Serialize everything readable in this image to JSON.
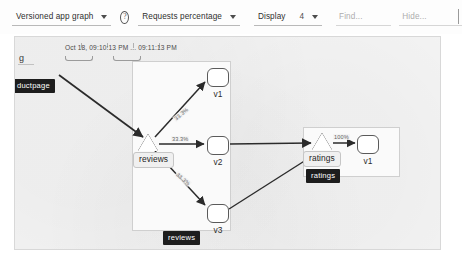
{
  "toolbar": {
    "graph_type": {
      "label": "Versioned app graph",
      "icon": "chevron-down-icon"
    },
    "help": {
      "icon": "help-circle-icon",
      "glyph": "?"
    },
    "edge_labels": {
      "label": "Requests percentage",
      "icon": "chevron-down-icon"
    },
    "display": {
      "label": "Display",
      "value": "4",
      "icon": "chevron-down-icon"
    },
    "find": {
      "placeholder": "Find..."
    },
    "hide": {
      "placeholder": "Hide..."
    }
  },
  "canvas": {
    "time_range": "Oct 18, 09:10:13 PM ... 09:11:13 PM",
    "g_letter": "g",
    "badges": {
      "productpage": "ductpage",
      "reviews": "reviews",
      "ratings": "ratings"
    },
    "clusters": [
      {
        "name": "reviews",
        "service_label": "reviews"
      },
      {
        "name": "ratings",
        "service_label": "ratings"
      }
    ],
    "nodes": [
      {
        "id": "reviews-svc",
        "shape": "triangle",
        "label": "reviews"
      },
      {
        "id": "reviews-v1",
        "shape": "rounded-box",
        "label": "v1"
      },
      {
        "id": "reviews-v2",
        "shape": "rounded-box",
        "label": "v2"
      },
      {
        "id": "reviews-v3",
        "shape": "rounded-box",
        "label": "v3"
      },
      {
        "id": "ratings-svc",
        "shape": "triangle",
        "label": "ratings"
      },
      {
        "id": "ratings-v1",
        "shape": "rounded-box",
        "label": "v1"
      }
    ],
    "edges": [
      {
        "from": "productpage",
        "to": "reviews-svc",
        "label": ""
      },
      {
        "from": "reviews-svc",
        "to": "reviews-v1",
        "label": "33.3%"
      },
      {
        "from": "reviews-svc",
        "to": "reviews-v2",
        "label": "33.3%"
      },
      {
        "from": "reviews-svc",
        "to": "reviews-v3",
        "label": "33.3%"
      },
      {
        "from": "reviews-v2",
        "to": "ratings-svc",
        "label": ""
      },
      {
        "from": "reviews-v3",
        "to": "ratings-svc",
        "label": ""
      },
      {
        "from": "ratings-svc",
        "to": "ratings-v1",
        "label": "100%"
      }
    ]
  }
}
